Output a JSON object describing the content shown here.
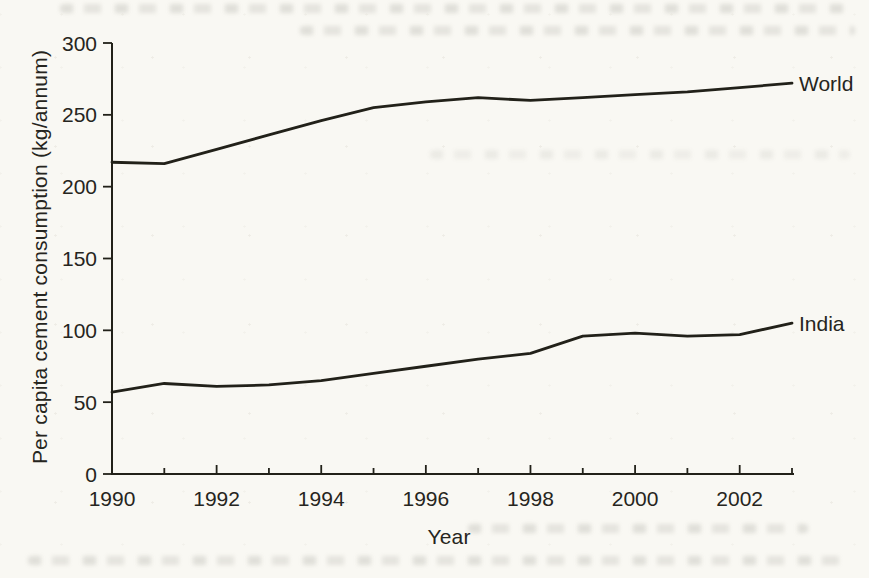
{
  "page": {
    "paper_color": "#f9f8f3",
    "ink_color": "#222119"
  },
  "chart_data": {
    "type": "line",
    "title": "",
    "xlabel": "Year",
    "ylabel": "Per capita cement consumption (kg/annum)",
    "x": [
      1990,
      1991,
      1992,
      1993,
      1994,
      1995,
      1996,
      1997,
      1998,
      1999,
      2000,
      2001,
      2002,
      2003
    ],
    "series": [
      {
        "name": "World",
        "values": [
          217,
          216,
          226,
          236,
          246,
          255,
          259,
          262,
          260,
          262,
          264,
          266,
          269,
          272
        ]
      },
      {
        "name": "India",
        "values": [
          57,
          63,
          61,
          62,
          65,
          70,
          75,
          80,
          84,
          96,
          98,
          96,
          97,
          105
        ]
      }
    ],
    "xlim": [
      1990,
      2003
    ],
    "ylim": [
      0,
      300
    ],
    "y_ticks": [
      0,
      50,
      100,
      150,
      200,
      250,
      300
    ],
    "x_ticks_labeled": [
      1990,
      1992,
      1994,
      1996,
      1998,
      2000,
      2002
    ],
    "x_ticks_minor": [
      1991,
      1993,
      1995,
      1997,
      1999,
      2001,
      2003
    ],
    "grid": false,
    "legend_position": "labels-at-line-ends",
    "line_color": "#222119"
  }
}
